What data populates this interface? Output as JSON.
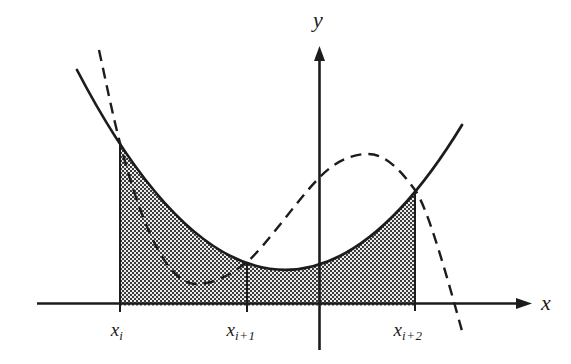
{
  "figure": {
    "axis_labels": {
      "y": "y",
      "x": "x"
    },
    "tick_labels": [
      {
        "base": "x",
        "sub": "i"
      },
      {
        "base": "x",
        "sub": "i+1"
      },
      {
        "base": "x",
        "sub": "i+2"
      }
    ],
    "colors": {
      "line": "#1c1c1c",
      "hatch_dark": "#3b3b3b",
      "hatch_light": "#ebebeb",
      "background": "#ffffff"
    }
  }
}
